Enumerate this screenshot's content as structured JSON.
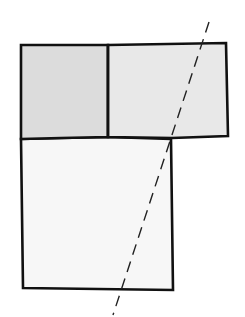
{
  "diagram": {
    "colors": {
      "background": "#ffffff",
      "stroke": "#111111",
      "panel_left_fill": "#dcdcdc",
      "panel_right_fill": "#e8e8e8",
      "panel_bottom_fill": "#f7f7f7",
      "dashed_line": "#222222"
    },
    "shapes": {
      "top_left_panel": {
        "points": "21,45 108,45 108,137 61,138 21,139"
      },
      "top_right_panel": {
        "points": "108,45 226,43 228,136 172,138 108,137"
      },
      "bottom_panel": {
        "points": "21,139 61,138 108,137 171,139 173,290 23,288"
      },
      "divider": {
        "x1": 108,
        "y1": 45,
        "x2": 108,
        "y2": 137
      },
      "fold_line": {
        "x1": 209,
        "y1": 22,
        "x2": 113,
        "y2": 315,
        "dash": "11,7"
      }
    }
  }
}
